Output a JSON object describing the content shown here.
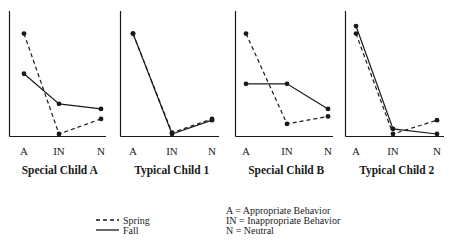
{
  "chart_data": [
    {
      "type": "line",
      "title": "Special Child A",
      "categories": [
        "A",
        "IN",
        "N"
      ],
      "series": [
        {
          "name": "Spring",
          "style": "dashed",
          "values": [
            82,
            2,
            14
          ]
        },
        {
          "name": "Fall",
          "style": "solid",
          "values": [
            50,
            26,
            22
          ]
        }
      ],
      "xlabel": "",
      "ylabel": "",
      "ylim": [
        0,
        100
      ],
      "grid": false
    },
    {
      "type": "line",
      "title": "Typical Child 1",
      "categories": [
        "A",
        "IN",
        "N"
      ],
      "series": [
        {
          "name": "Spring",
          "style": "dashed",
          "values": [
            82,
            3,
            14
          ]
        },
        {
          "name": "Fall",
          "style": "solid",
          "values": [
            82,
            2,
            13
          ]
        }
      ],
      "xlabel": "",
      "ylabel": "",
      "ylim": [
        0,
        100
      ],
      "grid": false
    },
    {
      "type": "line",
      "title": "Special Child B",
      "categories": [
        "A",
        "IN",
        "N"
      ],
      "series": [
        {
          "name": "Spring",
          "style": "dashed",
          "values": [
            82,
            10,
            16
          ]
        },
        {
          "name": "Fall",
          "style": "solid",
          "values": [
            42,
            42,
            22
          ]
        }
      ],
      "xlabel": "",
      "ylabel": "",
      "ylim": [
        0,
        100
      ],
      "grid": false
    },
    {
      "type": "line",
      "title": "Typical Child 2",
      "categories": [
        "A",
        "IN",
        "N"
      ],
      "series": [
        {
          "name": "Spring",
          "style": "dashed",
          "values": [
            82,
            2,
            13
          ]
        },
        {
          "name": "Fall",
          "style": "solid",
          "values": [
            88,
            6,
            2
          ]
        }
      ],
      "xlabel": "",
      "ylabel": "",
      "ylim": [
        0,
        100
      ],
      "grid": false
    }
  ],
  "legend": {
    "position": "bottom",
    "series": [
      {
        "name": "Spring",
        "style": "dashed"
      },
      {
        "name": "Fall",
        "style": "solid"
      }
    ],
    "key": [
      "A = Appropriate Behavior",
      "IN = Inappropriate Behavior",
      "N = Neutral"
    ]
  },
  "colors": {
    "ink": "#1a1a1a",
    "background": "#ffffff"
  }
}
